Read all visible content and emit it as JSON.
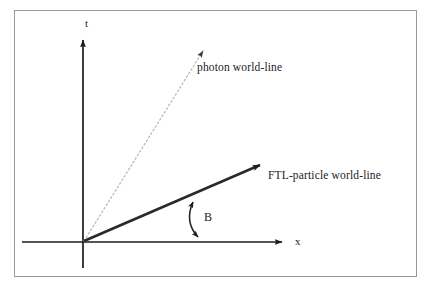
{
  "figure": {
    "type": "spacetime-diagram",
    "background_color": "#ffffff",
    "frame_color": "#9a9a9a",
    "ink_color": "#1c1c1c",
    "photon_line_color": "#b9b9b9",
    "ftl_line_color": "#2a2a2a"
  },
  "axes": {
    "vertical": {
      "label": "t",
      "name": "time-axis",
      "origin": [
        83,
        242
      ],
      "tip": [
        83,
        36
      ]
    },
    "horizontal": {
      "label": "x",
      "name": "space-axis",
      "origin": [
        83,
        242
      ],
      "tip": [
        287,
        242
      ]
    }
  },
  "worldlines": [
    {
      "id": "photon",
      "label": "photon world-line",
      "style": "dotted",
      "from": [
        83,
        242
      ],
      "to": [
        206,
        46
      ],
      "angle_from_x_axis_deg": 58
    },
    {
      "id": "ftl",
      "label": "FTL-particle world-line",
      "style": "solid-thick",
      "from": [
        83,
        242
      ],
      "to": [
        265,
        162
      ],
      "angle_from_x_axis_deg": 24
    }
  ],
  "annotations": {
    "angle": {
      "label": "B",
      "name": "angle-B",
      "arc_from": [
        192,
        199
      ],
      "arc_to": [
        199,
        240
      ],
      "double_headed": true
    }
  }
}
